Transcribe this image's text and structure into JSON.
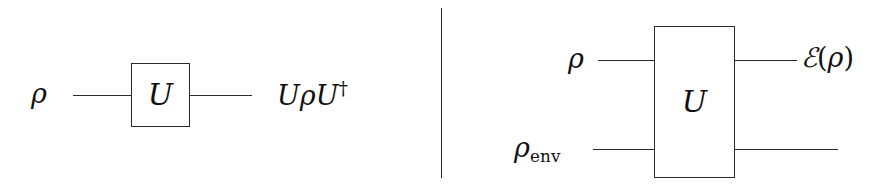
{
  "figure": {
    "kind": "quantum-circuit-diagram",
    "panels": 2,
    "ink_color": "#2b2b2b",
    "background_color": "#ffffff"
  },
  "left_panel": {
    "name": "unitary-evolution-circuit",
    "input_label": "ρ",
    "gate_label": "U",
    "output_label_parts": {
      "u1": "U",
      "rho": "ρ",
      "u2": "U",
      "dagger": "†"
    },
    "output_label_plain": "UρU†"
  },
  "divider": {
    "name": "panel-divider",
    "orientation": "vertical"
  },
  "right_panel": {
    "name": "open-system-evolution-circuit",
    "input_label_top": "ρ",
    "input_label_bottom_parts": {
      "base": "ρ",
      "subscript": "env"
    },
    "input_label_bottom_plain": "ρenv",
    "gate_label": "U",
    "output_label_parts": {
      "script_e": "ℰ",
      "open_paren": "(",
      "rho": "ρ",
      "close_paren": ")"
    },
    "output_label_plain": "ℰ(ρ)"
  }
}
